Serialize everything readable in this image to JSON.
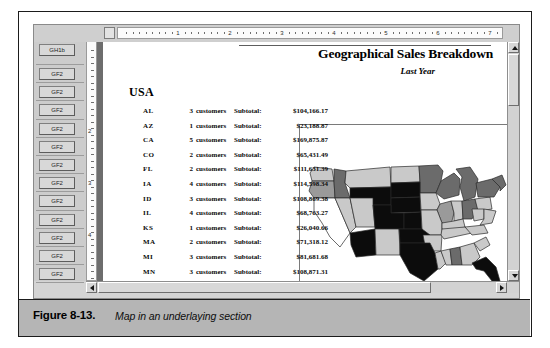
{
  "figure": {
    "caption_label": "Figure 8-13.",
    "caption_text": "Map in an underlaying section"
  },
  "window": {
    "hruler": {
      "corner_label": "",
      "numbers": [
        "1",
        "2",
        "3",
        "4",
        "5",
        "6",
        "7"
      ]
    },
    "vruler": {
      "numbers": [
        "2",
        "3",
        "4"
      ]
    },
    "scrollbars": {
      "vertical_up_icon": "scroll-up-arrow-icon",
      "vertical_down_icon": "scroll-down-arrow-icon",
      "horizontal_left_icon": "scroll-left-arrow-icon",
      "horizontal_right_icon": "scroll-right-arrow-icon"
    }
  },
  "section_gutter": {
    "items": [
      {
        "label": "GH1b"
      },
      {
        "label": "GF2"
      },
      {
        "label": "GF2"
      },
      {
        "label": "GF2"
      },
      {
        "label": "GF2"
      },
      {
        "label": "GF2"
      },
      {
        "label": "GF2"
      },
      {
        "label": "GF2"
      },
      {
        "label": "GF2"
      },
      {
        "label": "GF2"
      },
      {
        "label": "GF2"
      },
      {
        "label": "GF2"
      },
      {
        "label": "GF2"
      }
    ]
  },
  "report": {
    "title": "Geographical Sales Breakdown",
    "subtitle": "Last Year",
    "group_header": "USA",
    "customers_label": "customers",
    "subtotal_label": "Subtotal:",
    "rows": [
      {
        "state": "AL",
        "count": "3",
        "customers_label": "customers",
        "subtotal_label": "Subtotal:",
        "amount": "$104,166.17"
      },
      {
        "state": "AZ",
        "count": "1",
        "customers_label": "customers",
        "subtotal_label": "Subtotal:",
        "amount": "$23,188.87"
      },
      {
        "state": "CA",
        "count": "5",
        "customers_label": "customers",
        "subtotal_label": "Subtotal:",
        "amount": "$169,875.87"
      },
      {
        "state": "CO",
        "count": "2",
        "customers_label": "customers",
        "subtotal_label": "Subtotal:",
        "amount": "$65,431.49"
      },
      {
        "state": "FL",
        "count": "2",
        "customers_label": "customers",
        "subtotal_label": "Subtotal:",
        "amount": "$111,631.39"
      },
      {
        "state": "IA",
        "count": "4",
        "customers_label": "customers",
        "subtotal_label": "Subtotal:",
        "amount": "$114,598.34"
      },
      {
        "state": "ID",
        "count": "3",
        "customers_label": "customers",
        "subtotal_label": "Subtotal:",
        "amount": "$108,869.38"
      },
      {
        "state": "IL",
        "count": "4",
        "customers_label": "customers",
        "subtotal_label": "Subtotal:",
        "amount": "$68,763.27"
      },
      {
        "state": "KS",
        "count": "1",
        "customers_label": "customers",
        "subtotal_label": "Subtotal:",
        "amount": "$26,040.66"
      },
      {
        "state": "MA",
        "count": "2",
        "customers_label": "customers",
        "subtotal_label": "Subtotal:",
        "amount": "$71,318.12"
      },
      {
        "state": "MI",
        "count": "3",
        "customers_label": "customers",
        "subtotal_label": "Subtotal:",
        "amount": "$81,681.68"
      },
      {
        "state": "MN",
        "count": "3",
        "customers_label": "customers",
        "subtotal_label": "Subtotal:",
        "amount": "$108,871.31"
      }
    ]
  },
  "map": {
    "name": "usa-choropleth-map",
    "shades": {
      "none": "#ffffff",
      "light": "#c9c9c9",
      "medium": "#9a9a9a",
      "dark": "#6b6b6b",
      "max": "#0c0c0c"
    },
    "outline_color": "#2a2a2a",
    "regions": [
      {
        "id": "WA",
        "shade": "light"
      },
      {
        "id": "OR",
        "shade": "medium"
      },
      {
        "id": "ID",
        "shade": "dark"
      },
      {
        "id": "MT",
        "shade": "light"
      },
      {
        "id": "ND",
        "shade": "light"
      },
      {
        "id": "MN",
        "shade": "dark"
      },
      {
        "id": "WI",
        "shade": "dark"
      },
      {
        "id": "MI",
        "shade": "dark"
      },
      {
        "id": "WY",
        "shade": "max"
      },
      {
        "id": "SD",
        "shade": "max"
      },
      {
        "id": "NE",
        "shade": "max"
      },
      {
        "id": "IA",
        "shade": "light"
      },
      {
        "id": "IL",
        "shade": "medium"
      },
      {
        "id": "IN",
        "shade": "light"
      },
      {
        "id": "OH",
        "shade": "dark"
      },
      {
        "id": "CA",
        "shade": "none"
      },
      {
        "id": "NV",
        "shade": "light"
      },
      {
        "id": "UT",
        "shade": "light"
      },
      {
        "id": "CO",
        "shade": "max"
      },
      {
        "id": "KS",
        "shade": "max"
      },
      {
        "id": "MO",
        "shade": "light"
      },
      {
        "id": "KY",
        "shade": "light"
      },
      {
        "id": "AZ",
        "shade": "max"
      },
      {
        "id": "NM",
        "shade": "light"
      },
      {
        "id": "OK",
        "shade": "max"
      },
      {
        "id": "AR",
        "shade": "light"
      },
      {
        "id": "TN",
        "shade": "light"
      },
      {
        "id": "NC",
        "shade": "light"
      },
      {
        "id": "TX",
        "shade": "max"
      },
      {
        "id": "LA",
        "shade": "light"
      },
      {
        "id": "MS",
        "shade": "light"
      },
      {
        "id": "AL",
        "shade": "dark"
      },
      {
        "id": "GA",
        "shade": "light"
      },
      {
        "id": "SC",
        "shade": "light"
      },
      {
        "id": "FL",
        "shade": "max"
      },
      {
        "id": "NY",
        "shade": "dark"
      },
      {
        "id": "PA",
        "shade": "light"
      },
      {
        "id": "WV",
        "shade": "light"
      },
      {
        "id": "VA",
        "shade": "light"
      },
      {
        "id": "NewEngland",
        "shade": "dark"
      }
    ]
  }
}
